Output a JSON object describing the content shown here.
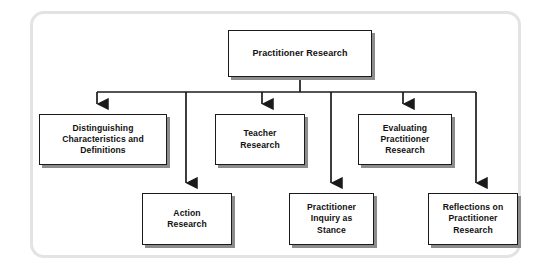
{
  "diagram": {
    "type": "tree",
    "orientation": "top-down",
    "root": {
      "id": "practitioner-research",
      "label": "Practitioner Research"
    },
    "children": [
      {
        "id": "distinguishing-characteristics-and-definitions",
        "label": "Distinguishing\nCharacteristics and\nDefinitions",
        "row": "upper",
        "order": 1
      },
      {
        "id": "action-research",
        "label": "Action\nResearch",
        "row": "lower",
        "order": 2
      },
      {
        "id": "teacher-research",
        "label": "Teacher\nResearch",
        "row": "upper",
        "order": 3
      },
      {
        "id": "practitioner-inquiry-as-stance",
        "label": "Practitioner\nInquiry as\nStance",
        "row": "lower",
        "order": 4
      },
      {
        "id": "evaluating-practitioner-research",
        "label": "Evaluating\nPractitioner\nResearch",
        "row": "upper",
        "order": 5
      },
      {
        "id": "reflections-on-practitioner-research",
        "label": "Reflections on\nPractitioner\nResearch",
        "row": "lower",
        "order": 6
      }
    ],
    "colors": {
      "frame_border": "#e3e3e3",
      "node_border": "#1a1a1a",
      "node_fill": "#ffffff",
      "node_shadow": "#8c8c8c",
      "connector": "#1a1a1a",
      "text": "#111111",
      "background": "#ffffff"
    },
    "connector_style": {
      "line": "orthogonal-bus",
      "arrowhead": "solid-triangle",
      "bus_y": 92
    }
  }
}
